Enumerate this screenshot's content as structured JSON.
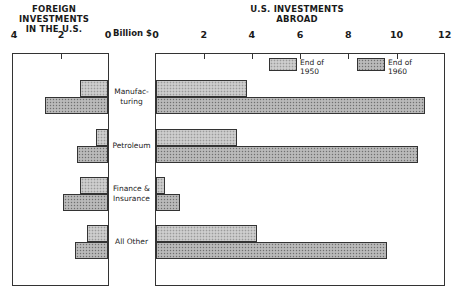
{
  "left_title": {
    "line1": "FOREIGN INVESTMENTS",
    "line2": "IN THE U.S."
  },
  "right_title": {
    "line1": "U.S. INVESTMENTS",
    "line2": "ABROAD"
  },
  "unit_label": "Billion $",
  "left_axis_ticks": [
    "4",
    "2",
    "0"
  ],
  "right_axis_ticks": [
    "0",
    "2",
    "4",
    "6",
    "8",
    "10",
    "12"
  ],
  "legend": [
    {
      "line1": "End of",
      "line2": "1950"
    },
    {
      "line1": "End of",
      "line2": "1960"
    }
  ],
  "categories": [
    {
      "line1": "Manufac-",
      "line2": "turing"
    },
    {
      "line1": "Petroleum",
      "line2": ""
    },
    {
      "line1": "Finance &",
      "line2": "Insurance"
    },
    {
      "line1": "All Other",
      "line2": ""
    }
  ],
  "chart_data": {
    "type": "bar",
    "orientation": "horizontal",
    "layout": "back-to-back (butterfly)",
    "unit": "Billion $",
    "categories": [
      "Manufacturing",
      "Petroleum",
      "Finance & Insurance",
      "All Other"
    ],
    "panels": [
      {
        "title": "FOREIGN INVESTMENTS IN THE U.S.",
        "xlim": [
          4,
          0
        ],
        "ticks": [
          4,
          2,
          0
        ],
        "direction": "leftward",
        "series": [
          {
            "name": "End of 1950",
            "values": [
              1.2,
              0.5,
              1.2,
              0.9
            ]
          },
          {
            "name": "End of 1960",
            "values": [
              2.7,
              1.3,
              1.9,
              1.4
            ]
          }
        ]
      },
      {
        "title": "U.S. INVESTMENTS ABROAD",
        "xlim": [
          0,
          12
        ],
        "ticks": [
          0,
          2,
          4,
          6,
          8,
          10,
          12
        ],
        "direction": "rightward",
        "series": [
          {
            "name": "End of 1950",
            "values": [
              3.8,
              3.4,
              0.4,
              4.2
            ]
          },
          {
            "name": "End of 1960",
            "values": [
              11.2,
              10.9,
              1.0,
              9.6
            ]
          }
        ]
      }
    ],
    "legend": [
      "End of 1950",
      "End of 1960"
    ],
    "legend_position": "top-right inside right panel",
    "grid": false
  }
}
